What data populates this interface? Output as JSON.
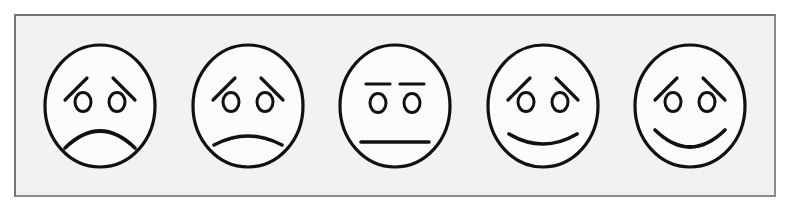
{
  "figure": {
    "name": "smiley-face-rating-scale",
    "caption": "",
    "panel": {
      "background_color": "#f2f2f2",
      "border_color": "#8a8a8a",
      "ink_color": "#111111"
    }
  },
  "scale": {
    "type": "likert-5-point-faces",
    "orientation": "horizontal",
    "low_end": "very unhappy",
    "high_end": "very happy",
    "faces": [
      {
        "id": "face-1",
        "position": 1,
        "label": "Very unhappy",
        "expression": "very-sad",
        "mouth": "deep-frown",
        "brows": "slanted-inner-raised",
        "eyes": "round-open"
      },
      {
        "id": "face-2",
        "position": 2,
        "label": "Unhappy",
        "expression": "sad",
        "mouth": "shallow-frown",
        "brows": "slanted-inner-raised",
        "eyes": "round-open"
      },
      {
        "id": "face-3",
        "position": 3,
        "label": "Neutral",
        "expression": "neutral",
        "mouth": "straight-line",
        "brows": "flat-horizontal",
        "eyes": "round-open"
      },
      {
        "id": "face-4",
        "position": 4,
        "label": "Happy",
        "expression": "slightly-happy",
        "mouth": "shallow-smile",
        "brows": "slanted-inner-raised",
        "eyes": "round-open"
      },
      {
        "id": "face-5",
        "position": 5,
        "label": "Very happy",
        "expression": "very-happy",
        "mouth": "deep-smile",
        "brows": "slanted-inner-raised",
        "eyes": "round-open"
      }
    ]
  }
}
